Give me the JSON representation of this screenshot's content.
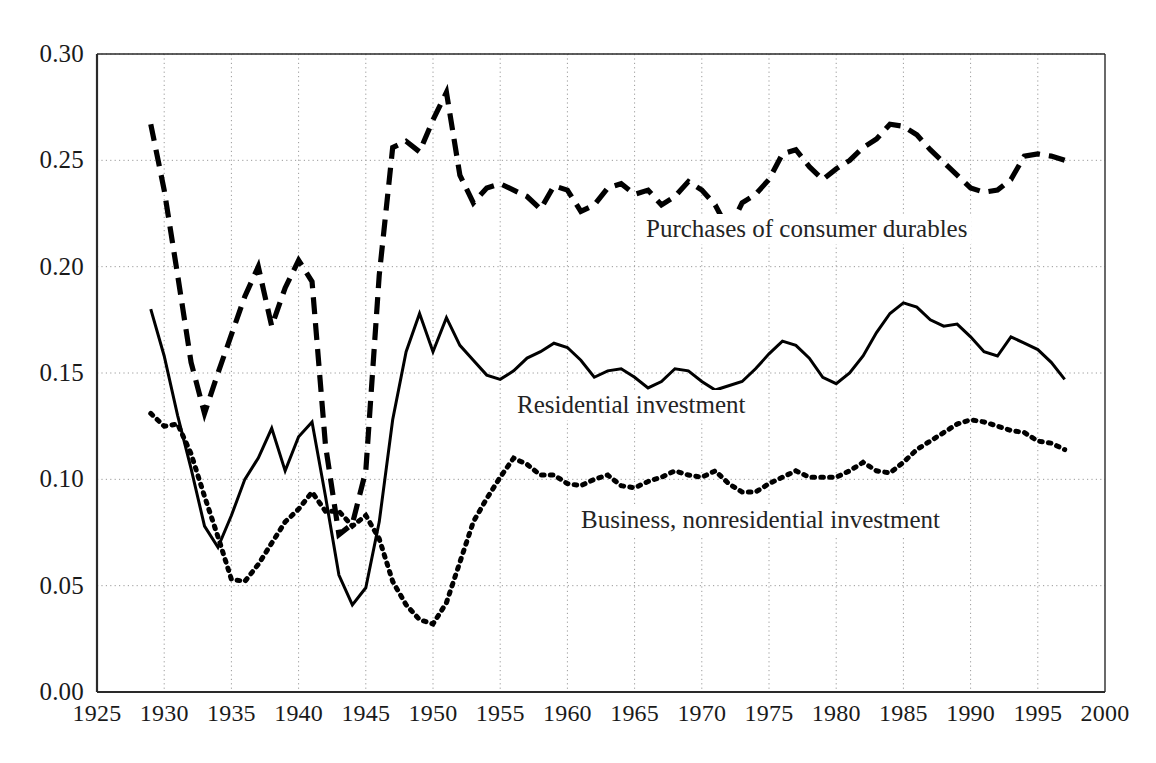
{
  "chart_data": {
    "type": "line",
    "title": "",
    "subtitle": "",
    "xlabel": "",
    "ylabel": "",
    "xlim": [
      1925,
      2000
    ],
    "ylim": [
      0.0,
      0.3
    ],
    "grid": true,
    "legend_position": "inline-annotations",
    "x_ticks": [
      "1925",
      "1930",
      "1935",
      "1940",
      "1945",
      "1950",
      "1955",
      "1960",
      "1965",
      "1970",
      "1975",
      "1980",
      "1985",
      "1990",
      "1995",
      "2000"
    ],
    "y_ticks": [
      "0.00",
      "0.05",
      "0.10",
      "0.15",
      "0.20",
      "0.25",
      "0.30"
    ],
    "x": [
      1929,
      1930,
      1931,
      1932,
      1933,
      1934,
      1935,
      1936,
      1937,
      1938,
      1939,
      1940,
      1941,
      1942,
      1943,
      1944,
      1945,
      1946,
      1947,
      1948,
      1949,
      1950,
      1951,
      1952,
      1953,
      1954,
      1955,
      1956,
      1957,
      1958,
      1959,
      1960,
      1961,
      1962,
      1963,
      1964,
      1965,
      1966,
      1967,
      1968,
      1969,
      1970,
      1971,
      1972,
      1973,
      1974,
      1975,
      1976,
      1977,
      1978,
      1979,
      1980,
      1981,
      1982,
      1983,
      1984,
      1985,
      1986,
      1987,
      1988,
      1989,
      1990,
      1991,
      1992,
      1993,
      1994,
      1995,
      1996,
      1997
    ],
    "series": [
      {
        "name": "Purchases of consumer durables",
        "style": "dashed",
        "color": "#000000",
        "annotation": "Purchases of consumer durables",
        "values": [
          0.267,
          0.236,
          0.196,
          0.155,
          0.131,
          0.15,
          0.168,
          0.186,
          0.2,
          0.172,
          0.19,
          0.203,
          0.193,
          0.116,
          0.074,
          0.079,
          0.104,
          0.196,
          0.256,
          0.259,
          0.254,
          0.269,
          0.282,
          0.243,
          0.23,
          0.237,
          0.239,
          0.236,
          0.233,
          0.227,
          0.238,
          0.236,
          0.226,
          0.229,
          0.237,
          0.239,
          0.234,
          0.236,
          0.229,
          0.233,
          0.24,
          0.236,
          0.229,
          0.217,
          0.23,
          0.234,
          0.241,
          0.253,
          0.255,
          0.247,
          0.241,
          0.246,
          0.25,
          0.256,
          0.26,
          0.267,
          0.266,
          0.262,
          0.255,
          0.249,
          0.243,
          0.237,
          0.235,
          0.236,
          0.241,
          0.252,
          0.253,
          0.252,
          0.25
        ]
      },
      {
        "name": "Residential investment",
        "style": "solid",
        "color": "#000000",
        "annotation": "Residential investment",
        "values": [
          0.18,
          0.158,
          0.13,
          0.105,
          0.078,
          0.068,
          0.083,
          0.1,
          0.11,
          0.124,
          0.104,
          0.12,
          0.127,
          0.092,
          0.055,
          0.041,
          0.049,
          0.08,
          0.128,
          0.16,
          0.178,
          0.16,
          0.176,
          0.163,
          0.156,
          0.149,
          0.147,
          0.151,
          0.157,
          0.16,
          0.164,
          0.162,
          0.156,
          0.148,
          0.151,
          0.152,
          0.148,
          0.143,
          0.146,
          0.152,
          0.151,
          0.146,
          0.142,
          0.144,
          0.146,
          0.152,
          0.159,
          0.165,
          0.163,
          0.157,
          0.148,
          0.145,
          0.15,
          0.158,
          0.169,
          0.178,
          0.183,
          0.181,
          0.175,
          0.172,
          0.173,
          0.167,
          0.16,
          0.158,
          0.167,
          0.164,
          0.161,
          0.155,
          0.147
        ]
      },
      {
        "name": "Business, nonresidential investment",
        "style": "dotted",
        "color": "#000000",
        "annotation": "Business, nonresidential investment",
        "values": [
          0.131,
          0.125,
          0.126,
          0.112,
          0.092,
          0.073,
          0.053,
          0.052,
          0.06,
          0.07,
          0.08,
          0.086,
          0.094,
          0.085,
          0.085,
          0.078,
          0.083,
          0.072,
          0.052,
          0.041,
          0.034,
          0.032,
          0.042,
          0.061,
          0.08,
          0.091,
          0.101,
          0.11,
          0.107,
          0.102,
          0.102,
          0.098,
          0.097,
          0.1,
          0.102,
          0.097,
          0.096,
          0.099,
          0.101,
          0.104,
          0.102,
          0.101,
          0.104,
          0.098,
          0.094,
          0.094,
          0.098,
          0.101,
          0.104,
          0.101,
          0.101,
          0.101,
          0.104,
          0.108,
          0.104,
          0.103,
          0.108,
          0.114,
          0.118,
          0.122,
          0.126,
          0.128,
          0.127,
          0.125,
          0.123,
          0.122,
          0.118,
          0.117,
          0.114
        ]
      }
    ]
  }
}
